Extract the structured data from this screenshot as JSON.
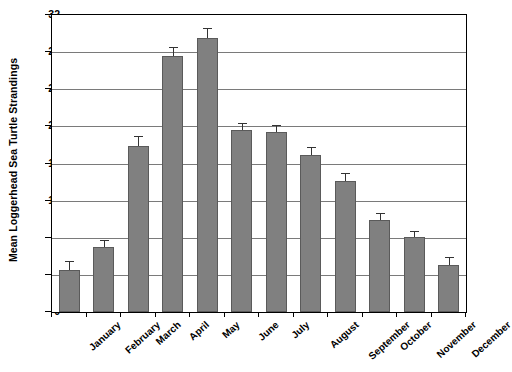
{
  "chart_data": {
    "type": "bar",
    "title": "",
    "xlabel": "",
    "ylabel": "Mean Loggerhead Sea Turtle Strandings",
    "categories": [
      "January",
      "February",
      "March",
      "April",
      "May",
      "June",
      "July",
      "August",
      "September",
      "October",
      "November",
      "December"
    ],
    "values": [
      4.5,
      7.0,
      17.9,
      27.6,
      29.5,
      19.6,
      19.4,
      16.9,
      14.1,
      9.9,
      8.1,
      5.1
    ],
    "errors_upper": [
      1.0,
      0.8,
      1.1,
      1.0,
      1.1,
      0.8,
      0.8,
      0.9,
      0.9,
      0.8,
      0.6,
      0.8
    ],
    "ylim": [
      0,
      32
    ],
    "yticks": [
      0,
      4,
      8,
      12,
      16,
      20,
      24,
      28,
      32
    ],
    "ytick_labels": [
      "0",
      "4",
      "8",
      "12",
      "16",
      "20",
      "24",
      "28",
      "32"
    ],
    "grid": true,
    "legend": "none",
    "error_bar_style": "upper-only",
    "bar_color": "#808080",
    "bar_edge_color": "#5a5a5a",
    "grid_color": "#7a7a7a",
    "axis_color": "#000000",
    "background_color": "#ffffff"
  }
}
